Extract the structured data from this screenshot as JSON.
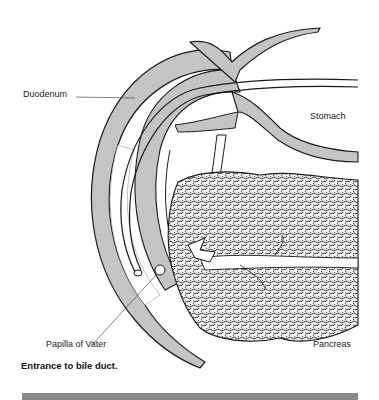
{
  "figure": {
    "labels": {
      "duodenum": "Duodenum",
      "stomach": "Stomach",
      "pancreas": "Pancreas",
      "papilla": "Papilla of Vater"
    },
    "caption": "Entrance to bile duct."
  },
  "colors": {
    "tissue_fill": "#c4c4c4",
    "outline": "#1a1a1a",
    "pancreas_texture": "#2a2a2a",
    "background": "#ffffff",
    "bottom_bar": "#8a8a8a"
  }
}
